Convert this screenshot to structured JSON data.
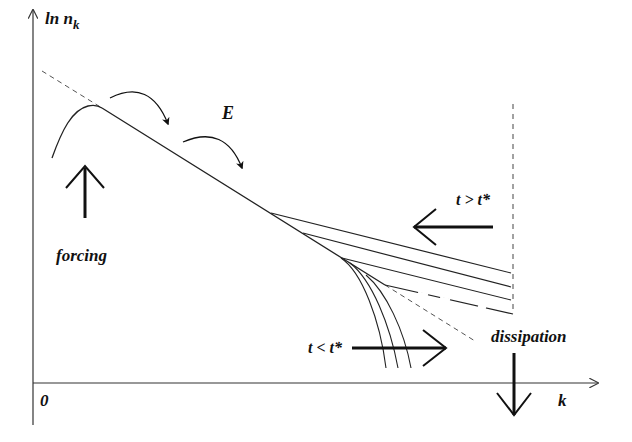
{
  "diagram": {
    "axes": {
      "y_label_main": "ln n",
      "y_label_sub": "k",
      "x_label": "k",
      "origin_label": "0"
    },
    "labels": {
      "energy_flux": "E",
      "forcing": "forcing",
      "dissipation": "dissipation",
      "late_time": "t > t*",
      "early_time": "t < t*"
    },
    "colors": {
      "ink": "#111111",
      "dashed": "#555555",
      "background": "#ffffff"
    }
  }
}
